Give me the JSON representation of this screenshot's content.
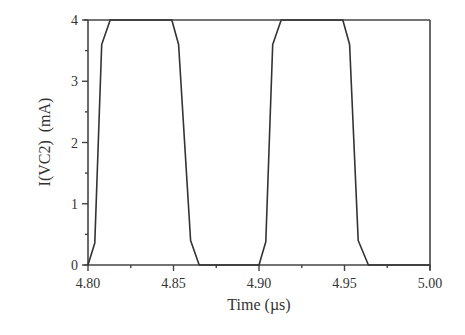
{
  "chart_data": {
    "type": "line",
    "title": "",
    "xlabel": "Time (µs)",
    "ylabel": "I(VC2)  (mA)",
    "xlim": [
      4.8,
      5.0
    ],
    "ylim": [
      0,
      4
    ],
    "x_ticks": [
      4.8,
      4.85,
      4.9,
      4.95,
      5.0
    ],
    "x_tick_labels": [
      "4.80",
      "4.85",
      "4.90",
      "4.95",
      "5.00"
    ],
    "x_minor_ticks": [
      4.825,
      4.875,
      4.925,
      4.975
    ],
    "y_ticks": [
      0,
      1,
      2,
      3,
      4
    ],
    "y_tick_labels": [
      "0",
      "1",
      "2",
      "3",
      "4"
    ],
    "y_minor_ticks": [
      0.5,
      1.5,
      2.5,
      3.5
    ],
    "grid": false,
    "legend": null,
    "series": [
      {
        "name": "I(VC2)",
        "color": "#333333",
        "x": [
          4.8,
          4.804,
          4.808,
          4.813,
          4.849,
          4.853,
          4.86,
          4.865,
          4.9,
          4.904,
          4.908,
          4.913,
          4.949,
          4.953,
          4.958,
          4.964,
          5.0
        ],
        "y": [
          0.0,
          0.36,
          3.6,
          4.0,
          4.0,
          3.6,
          0.4,
          0.0,
          0.0,
          0.38,
          3.6,
          4.0,
          4.0,
          3.6,
          0.4,
          0.0,
          0.0
        ]
      }
    ]
  },
  "layout": {
    "plot_left": 88,
    "plot_right": 430,
    "plot_top": 20,
    "plot_bottom": 265
  }
}
